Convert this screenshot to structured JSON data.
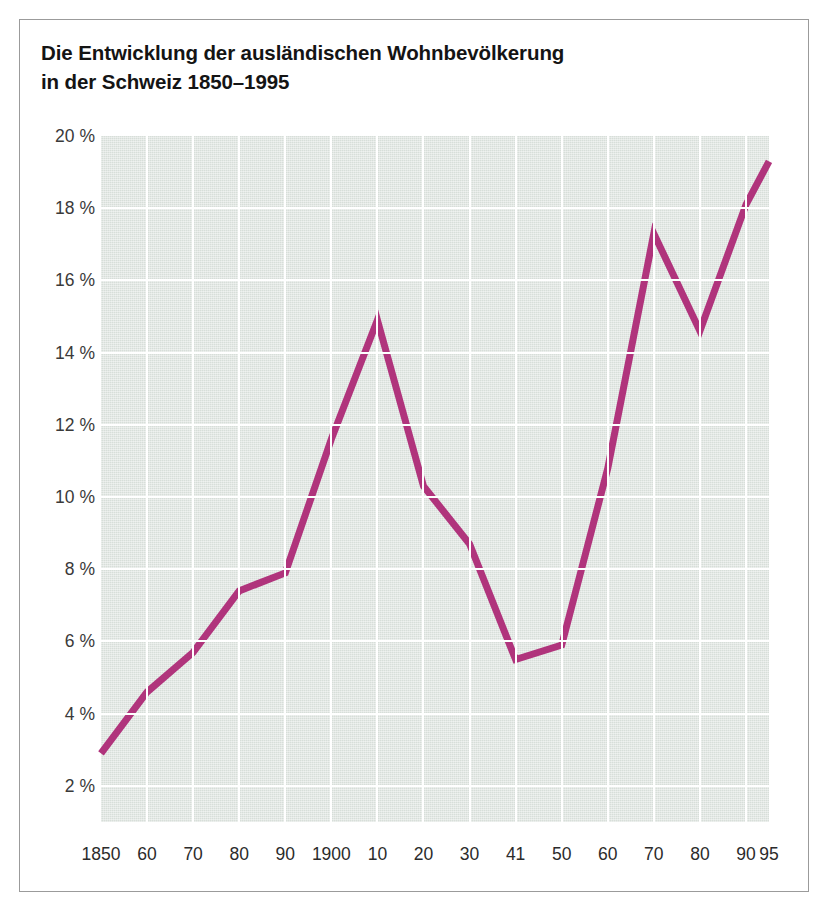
{
  "figure": {
    "title_line1": "Die Entwicklung der ausländischen Wohnbevölkerung",
    "title_line2": "in der Schweiz 1850–1995",
    "title": "Die Entwicklung der ausländischen Wohnbevölkerung\nin der Schweiz 1850–1995",
    "border_color": "#9b9b9b",
    "background": "#ffffff"
  },
  "chart_data": {
    "type": "line",
    "title": "Die Entwicklung der ausländischen Wohnbevölkerung in der Schweiz 1850–1995",
    "xlabel": "",
    "ylabel": "",
    "grid": true,
    "legend": false,
    "plot_background": "#d7ded9",
    "gridline_color": "#ffffff",
    "line_color": "#b0347c",
    "line_width": 7,
    "ylim": [
      1,
      20
    ],
    "yticks": [
      2,
      4,
      6,
      8,
      10,
      12,
      14,
      16,
      18,
      20
    ],
    "ytick_labels": [
      "2 %",
      "4 %",
      "6 %",
      "8 %",
      "10 %",
      "12 %",
      "14 %",
      "16 %",
      "18 %",
      "20 %"
    ],
    "categories": [
      "1850",
      "60",
      "70",
      "80",
      "90",
      "1900",
      "10",
      "20",
      "30",
      "41",
      "50",
      "60",
      "70",
      "80",
      "90",
      "95"
    ],
    "x": [
      1850,
      1860,
      1870,
      1880,
      1890,
      1900,
      1910,
      1920,
      1930,
      1941,
      1950,
      1960,
      1970,
      1980,
      1990,
      1995
    ],
    "values": [
      2.9,
      4.6,
      5.7,
      7.4,
      7.9,
      11.6,
      14.9,
      10.3,
      8.7,
      5.5,
      5.9,
      10.8,
      17.3,
      14.6,
      18.1,
      19.3
    ],
    "series": [
      {
        "name": "Ausländische Wohnbevölkerung (%)",
        "values": [
          2.9,
          4.6,
          5.7,
          7.4,
          7.9,
          11.6,
          14.9,
          10.3,
          8.7,
          5.5,
          5.9,
          10.8,
          17.3,
          14.6,
          18.1,
          19.3
        ]
      }
    ]
  }
}
